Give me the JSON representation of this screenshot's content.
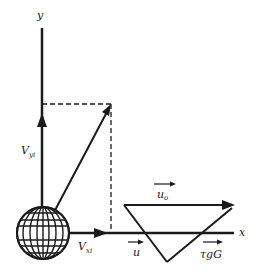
{
  "diagram": {
    "axes": {
      "y_label": "y",
      "x_label": "x"
    },
    "vectors": {
      "vy": {
        "label": "V",
        "subscript": "yi"
      },
      "vx": {
        "label": "V",
        "subscript": "xi"
      },
      "u0": {
        "label": "u",
        "subscript": "o"
      },
      "u": {
        "label": "u"
      },
      "tgG": {
        "label": "τgG"
      }
    },
    "colors": {
      "ink": "#1a1a1a",
      "background": "#ffffff"
    }
  }
}
